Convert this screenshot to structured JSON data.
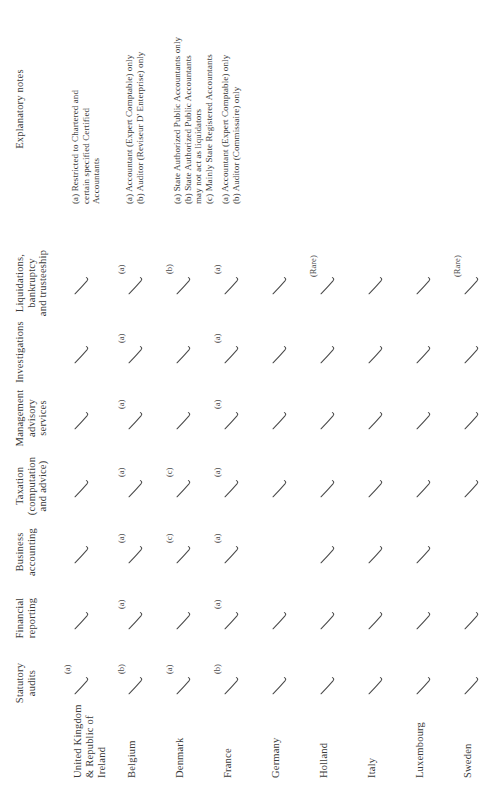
{
  "table": {
    "column_headers": [
      "Statutory\naudits",
      "Financial\nreporting",
      "Business\naccounting",
      "Taxation\n(computation\nand advice)",
      "Management\nadvisory\nservices",
      "Investigations",
      "Liquidations,\nbankruptcy\nand trusteeship"
    ],
    "notes_header": "Explanatory notes",
    "rows": [
      {
        "country": "United Kingdom\n& Republic of\nIreland",
        "cells": [
          {
            "tick": true,
            "note": "(a)"
          },
          {
            "tick": true,
            "note": ""
          },
          {
            "tick": true,
            "note": ""
          },
          {
            "tick": true,
            "note": ""
          },
          {
            "tick": true,
            "note": ""
          },
          {
            "tick": true,
            "note": ""
          },
          {
            "tick": true,
            "note": ""
          }
        ],
        "notes": "(a) Restricted to Chartered and\n      certain specified Certified\n      Accountants"
      },
      {
        "country": "Belgium",
        "cells": [
          {
            "tick": true,
            "note": "(b)"
          },
          {
            "tick": true,
            "note": "(a)"
          },
          {
            "tick": true,
            "note": "(a)"
          },
          {
            "tick": true,
            "note": "(a)"
          },
          {
            "tick": true,
            "note": "(a)"
          },
          {
            "tick": true,
            "note": "(a)"
          },
          {
            "tick": true,
            "note": "(a)"
          }
        ],
        "notes": "(a) Accountant (Expert Comptable) only\n(b) Auditor (Reviseur D' Enterprise) only"
      },
      {
        "country": "Denmark",
        "cells": [
          {
            "tick": true,
            "note": "(a)"
          },
          {
            "tick": true,
            "note": ""
          },
          {
            "tick": true,
            "note": "(c)"
          },
          {
            "tick": true,
            "note": "(c)"
          },
          {
            "tick": true,
            "note": ""
          },
          {
            "tick": true,
            "note": ""
          },
          {
            "tick": true,
            "note": "(b)"
          }
        ],
        "notes": "(a) State Authorized Public Accountants only\n(b) State Authorized Public Accountants\n      may not act as liquidators\n(c) Mainly State Registered Accountants"
      },
      {
        "country": "France",
        "cells": [
          {
            "tick": true,
            "note": "(b)"
          },
          {
            "tick": true,
            "note": "(a)"
          },
          {
            "tick": true,
            "note": "(a)"
          },
          {
            "tick": true,
            "note": "(a)"
          },
          {
            "tick": true,
            "note": "(a)"
          },
          {
            "tick": true,
            "note": "(a)"
          },
          {
            "tick": true,
            "note": "(a)"
          }
        ],
        "notes": "(a) Accountant (Expert Comptable) only\n(b) Auditor (Commissaire) only"
      },
      {
        "country": "Germany",
        "cells": [
          {
            "tick": true,
            "note": ""
          },
          {
            "tick": true,
            "note": ""
          },
          {
            "tick": false,
            "note": ""
          },
          {
            "tick": true,
            "note": ""
          },
          {
            "tick": true,
            "note": ""
          },
          {
            "tick": true,
            "note": ""
          },
          {
            "tick": true,
            "note": ""
          }
        ],
        "notes": ""
      },
      {
        "country": "Holland",
        "cells": [
          {
            "tick": true,
            "note": ""
          },
          {
            "tick": true,
            "note": ""
          },
          {
            "tick": true,
            "note": ""
          },
          {
            "tick": true,
            "note": ""
          },
          {
            "tick": true,
            "note": ""
          },
          {
            "tick": true,
            "note": ""
          },
          {
            "tick": true,
            "note": "(Rare)"
          }
        ],
        "notes": ""
      },
      {
        "country": "Italy",
        "cells": [
          {
            "tick": true,
            "note": ""
          },
          {
            "tick": true,
            "note": ""
          },
          {
            "tick": true,
            "note": ""
          },
          {
            "tick": true,
            "note": ""
          },
          {
            "tick": true,
            "note": ""
          },
          {
            "tick": true,
            "note": ""
          },
          {
            "tick": true,
            "note": ""
          }
        ],
        "notes": ""
      },
      {
        "country": "Luxembourg",
        "cells": [
          {
            "tick": true,
            "note": ""
          },
          {
            "tick": true,
            "note": ""
          },
          {
            "tick": true,
            "note": ""
          },
          {
            "tick": true,
            "note": ""
          },
          {
            "tick": true,
            "note": ""
          },
          {
            "tick": true,
            "note": ""
          },
          {
            "tick": true,
            "note": ""
          }
        ],
        "notes": ""
      },
      {
        "country": "Sweden",
        "cells": [
          {
            "tick": true,
            "note": ""
          },
          {
            "tick": true,
            "note": ""
          },
          {
            "tick": false,
            "note": ""
          },
          {
            "tick": true,
            "note": ""
          },
          {
            "tick": true,
            "note": ""
          },
          {
            "tick": true,
            "note": ""
          },
          {
            "tick": true,
            "note": "(Rare)"
          }
        ],
        "notes": ""
      },
      {
        "country": "Switzerland",
        "cells": [
          {
            "tick": true,
            "note": ""
          },
          {
            "tick": true,
            "note": ""
          },
          {
            "tick": true,
            "note": ""
          },
          {
            "tick": true,
            "note": ""
          },
          {
            "tick": true,
            "note": ""
          },
          {
            "tick": true,
            "note": ""
          },
          {
            "tick": true,
            "note": ""
          }
        ],
        "notes": ""
      }
    ]
  },
  "layout": {
    "col_x": [
      105,
      170,
      236,
      302,
      370,
      436,
      505
    ],
    "row_y": [
      78,
      132,
      180,
      228,
      276,
      324,
      372,
      420,
      468,
      516
    ],
    "notes_x": 586,
    "stroke_color": "#4a4a4a"
  }
}
